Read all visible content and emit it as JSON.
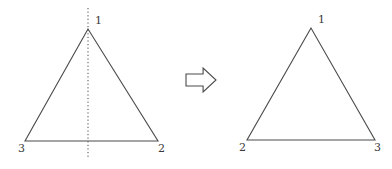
{
  "figure": {
    "background_color": "#ffffff",
    "stroke_color": "#4a4a4a",
    "label_color": "#3a3a3a",
    "width": 392,
    "height": 169
  },
  "left_triangle": {
    "name": "original-triangle",
    "vertices": [
      {
        "label": "1",
        "x": 88,
        "y": 29,
        "label_x": 95,
        "label_y": 24,
        "position": "apex"
      },
      {
        "label": "3",
        "x": 25,
        "y": 141,
        "label_x": 18,
        "label_y": 152,
        "position": "bottom-left"
      },
      {
        "label": "2",
        "x": 158,
        "y": 141,
        "label_x": 158,
        "label_y": 152,
        "position": "bottom-right"
      }
    ],
    "mirror_line": {
      "name": "vertical-axis-of-symmetry",
      "style": "dotted",
      "x": 88,
      "y_start": 8,
      "y_end": 158
    }
  },
  "arrow": {
    "name": "transformation-arrow",
    "direction": "right",
    "style": "outline",
    "x": 186,
    "y": 68,
    "width": 30,
    "height": 24
  },
  "right_triangle": {
    "name": "reflected-triangle",
    "vertices": [
      {
        "label": "1",
        "x": 311,
        "y": 28,
        "label_x": 318,
        "label_y": 23,
        "position": "apex"
      },
      {
        "label": "2",
        "x": 247,
        "y": 140,
        "label_x": 239,
        "label_y": 151,
        "position": "bottom-left"
      },
      {
        "label": "3",
        "x": 375,
        "y": 140,
        "label_x": 374,
        "label_y": 151,
        "position": "bottom-right"
      }
    ]
  }
}
